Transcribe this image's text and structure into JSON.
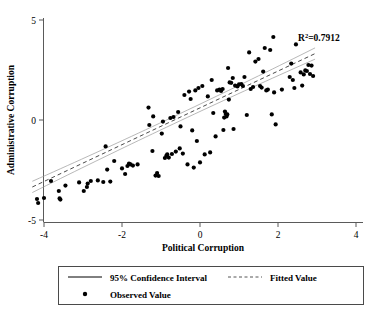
{
  "chart_data": {
    "type": "scatter",
    "title": "",
    "xlabel": "Political Corruption",
    "ylabel": "Administrative Corruption",
    "xlim": [
      -4.4,
      4.2
    ],
    "ylim": [
      -5.3,
      5.3
    ],
    "xticks": [
      -4,
      -2,
      0,
      2,
      4
    ],
    "xtick_labels": [
      "-4",
      "-2",
      "0",
      "2",
      "4"
    ],
    "yticks": [
      5,
      0,
      -5
    ],
    "ytick_labels": [
      "5",
      "0",
      "-5"
    ],
    "grid": false,
    "annotations": [
      {
        "name": "r-squared",
        "text_prefix": "R",
        "text_sup": "2",
        "text_suffix": "=0.7912",
        "full_text": "R2=0.7912",
        "x": 2.55,
        "y": 4.05
      }
    ],
    "legend": {
      "position": "below-axes",
      "entries": [
        {
          "label": "95% Confidence Interval",
          "marker": "solid-line"
        },
        {
          "label": "Fitted Value",
          "marker": "dashed-line"
        },
        {
          "label": "Observed Value",
          "marker": "dot"
        }
      ]
    },
    "series": [
      {
        "name": "Observed Value",
        "type": "scatter",
        "marker": "filled-circle",
        "color": "#000000",
        "points": [
          [
            -4.18,
            -3.95
          ],
          [
            -4.15,
            -4.15
          ],
          [
            -4.0,
            -3.9
          ],
          [
            -3.82,
            -3.05
          ],
          [
            -3.62,
            -3.55
          ],
          [
            -3.6,
            -3.92
          ],
          [
            -3.58,
            -3.98
          ],
          [
            -3.45,
            -3.28
          ],
          [
            -3.1,
            -3.12
          ],
          [
            -2.98,
            -3.55
          ],
          [
            -2.9,
            -3.35
          ],
          [
            -2.88,
            -3.18
          ],
          [
            -2.8,
            -3.05
          ],
          [
            -2.62,
            -3.02
          ],
          [
            -2.48,
            -3.1
          ],
          [
            -2.42,
            -1.32
          ],
          [
            -2.38,
            -2.48
          ],
          [
            -2.3,
            -3.08
          ],
          [
            -2.2,
            -2.05
          ],
          [
            -2.0,
            -2.42
          ],
          [
            -1.92,
            -2.7
          ],
          [
            -1.86,
            -2.3
          ],
          [
            -1.82,
            -2.18
          ],
          [
            -1.78,
            -2.22
          ],
          [
            -1.72,
            -2.28
          ],
          [
            -1.6,
            -2.22
          ],
          [
            -1.32,
            0.62
          ],
          [
            -1.3,
            -0.25
          ],
          [
            -1.22,
            -1.55
          ],
          [
            -1.2,
            0.18
          ],
          [
            -1.14,
            -2.78
          ],
          [
            -1.1,
            -2.65
          ],
          [
            -1.06,
            -2.8
          ],
          [
            -0.98,
            -0.68
          ],
          [
            -0.95,
            -0.08
          ],
          [
            -0.9,
            -1.9
          ],
          [
            -0.86,
            -1.78
          ],
          [
            -0.84,
            -1.72
          ],
          [
            -0.8,
            -1.88
          ],
          [
            -0.76,
            0.1
          ],
          [
            -0.72,
            -1.7
          ],
          [
            -0.68,
            0.15
          ],
          [
            -0.62,
            -1.58
          ],
          [
            -0.56,
            0.4
          ],
          [
            -0.52,
            -1.42
          ],
          [
            -0.5,
            -0.32
          ],
          [
            -0.44,
            -1.68
          ],
          [
            -0.4,
            1.25
          ],
          [
            -0.32,
            -2.22
          ],
          [
            -0.28,
            1.42
          ],
          [
            -0.24,
            1.05
          ],
          [
            -0.2,
            -0.52
          ],
          [
            -0.16,
            -2.38
          ],
          [
            -0.12,
            1.48
          ],
          [
            -0.08,
            -1.05
          ],
          [
            -0.04,
            1.6
          ],
          [
            0.0,
            -2.12
          ],
          [
            0.06,
            1.7
          ],
          [
            0.12,
            -1.72
          ],
          [
            0.2,
            1.18
          ],
          [
            0.26,
            -1.62
          ],
          [
            0.3,
            2.0
          ],
          [
            0.34,
            0.35
          ],
          [
            0.4,
            -0.82
          ],
          [
            0.44,
            1.48
          ],
          [
            0.5,
            1.52
          ],
          [
            0.54,
            1.45
          ],
          [
            0.58,
            1.55
          ],
          [
            0.6,
            -0.5
          ],
          [
            0.62,
            0.12
          ],
          [
            0.64,
            0.42
          ],
          [
            0.66,
            0.3
          ],
          [
            0.68,
            0.18
          ],
          [
            0.7,
            0.28
          ],
          [
            0.72,
            2.6
          ],
          [
            0.74,
            1.02
          ],
          [
            0.76,
            1.88
          ],
          [
            0.8,
            1.86
          ],
          [
            0.84,
            2.1
          ],
          [
            0.86,
            -0.45
          ],
          [
            0.9,
            1.72
          ],
          [
            0.96,
            1.68
          ],
          [
            1.0,
            1.78
          ],
          [
            1.06,
            1.8
          ],
          [
            1.1,
            1.7
          ],
          [
            1.14,
            2.15
          ],
          [
            1.2,
            0.25
          ],
          [
            1.26,
            3.38
          ],
          [
            1.3,
            1.55
          ],
          [
            1.36,
            1.65
          ],
          [
            1.42,
            2.92
          ],
          [
            1.5,
            3.05
          ],
          [
            1.54,
            1.7
          ],
          [
            1.58,
            1.62
          ],
          [
            1.62,
            2.42
          ],
          [
            1.66,
            3.6
          ],
          [
            1.7,
            1.48
          ],
          [
            1.74,
            1.52
          ],
          [
            1.8,
            3.5
          ],
          [
            1.84,
            0.28
          ],
          [
            1.88,
            4.15
          ],
          [
            1.9,
            1.38
          ],
          [
            1.94,
            -0.22
          ],
          [
            2.1,
            1.52
          ],
          [
            2.3,
            2.15
          ],
          [
            2.34,
            2.82
          ],
          [
            2.38,
            2.0
          ],
          [
            2.42,
            1.6
          ],
          [
            2.46,
            3.78
          ],
          [
            2.58,
            2.38
          ],
          [
            2.62,
            1.72
          ],
          [
            2.66,
            2.28
          ],
          [
            2.7,
            2.48
          ],
          [
            2.74,
            2.45
          ],
          [
            2.78,
            2.75
          ],
          [
            2.82,
            2.3
          ],
          [
            2.86,
            2.72
          ],
          [
            2.9,
            2.2
          ]
        ]
      },
      {
        "name": "Fitted Value",
        "type": "line",
        "style": "dashed",
        "color": "#4a4a4a",
        "endpoints": [
          [
            -4.3,
            -3.35
          ],
          [
            2.95,
            3.32
          ]
        ],
        "slope": 0.92,
        "intercept": 0.61
      },
      {
        "name": "95% Confidence Interval",
        "type": "band",
        "style": "solid",
        "color": "#9a9a9a"
      }
    ]
  }
}
